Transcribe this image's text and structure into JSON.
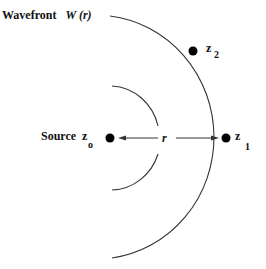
{
  "diagram": {
    "title": {
      "text": "Wavefront",
      "symbol": "W (r)"
    },
    "source": {
      "label": "Source",
      "var": "z",
      "sub": "o"
    },
    "points": [
      {
        "id": "z1",
        "var": "z",
        "sub": "1"
      },
      {
        "id": "z2",
        "var": "z",
        "sub": "2"
      }
    ],
    "radius_label": "r",
    "colors": {
      "stroke": "#333333",
      "dot": "#000000",
      "text": "#111111"
    }
  }
}
